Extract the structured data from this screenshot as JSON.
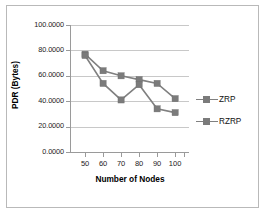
{
  "chart_data": {
    "type": "line",
    "title": "",
    "xlabel": "Number of Nodes",
    "ylabel": "PDR (Bytes)",
    "categories": [
      "50",
      "60",
      "70",
      "80",
      "90",
      "100"
    ],
    "x": [
      50,
      60,
      70,
      80,
      90,
      100
    ],
    "ylim": [
      0,
      100
    ],
    "yticks": [
      0,
      20,
      40,
      60,
      80,
      100
    ],
    "ytick_labels": [
      "0.0000",
      "20.0000",
      "40.0000",
      "60.0000",
      "80.0000",
      "100.0000"
    ],
    "grid": true,
    "legend_position": "right",
    "series": [
      {
        "name": "ZRP",
        "values": [
          77,
          64,
          60,
          57,
          54,
          42
        ],
        "color": "#808080",
        "marker": "square"
      },
      {
        "name": "RZRP",
        "values": [
          76,
          54,
          41,
          53,
          34,
          31
        ],
        "color": "#808080",
        "marker": "square"
      }
    ]
  },
  "legend": {
    "entries": [
      {
        "label": "ZRP"
      },
      {
        "label": "RZRP"
      }
    ]
  }
}
